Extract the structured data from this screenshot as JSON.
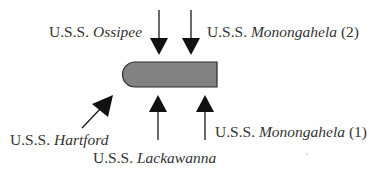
{
  "diagram": {
    "target": {
      "name": "ironclad-target",
      "fill": "#808080",
      "stroke": "#2a2a2a"
    },
    "labels": [
      {
        "id": "ossipee",
        "prefix": "U.S.S. ",
        "name": "Ossipee",
        "suffix": ""
      },
      {
        "id": "monongahela2",
        "prefix": "U.S.S. ",
        "name": "Monongahela",
        "suffix": " (2)"
      },
      {
        "id": "hartford",
        "prefix": "U.S.S. ",
        "name": "Hartford",
        "suffix": ""
      },
      {
        "id": "lackawanna",
        "prefix": "U.S.S. ",
        "name": "Lackawanna",
        "suffix": ""
      },
      {
        "id": "monongahela1",
        "prefix": "U.S.S. ",
        "name": "Monongahela",
        "suffix": " (1)"
      }
    ],
    "arrows": [
      {
        "ship": "Ossipee",
        "direction": "down"
      },
      {
        "ship": "Monongahela (2)",
        "direction": "down"
      },
      {
        "ship": "Hartford",
        "direction": "up-right"
      },
      {
        "ship": "Lackawanna",
        "direction": "up"
      },
      {
        "ship": "Monongahela (1)",
        "direction": "up"
      }
    ]
  }
}
